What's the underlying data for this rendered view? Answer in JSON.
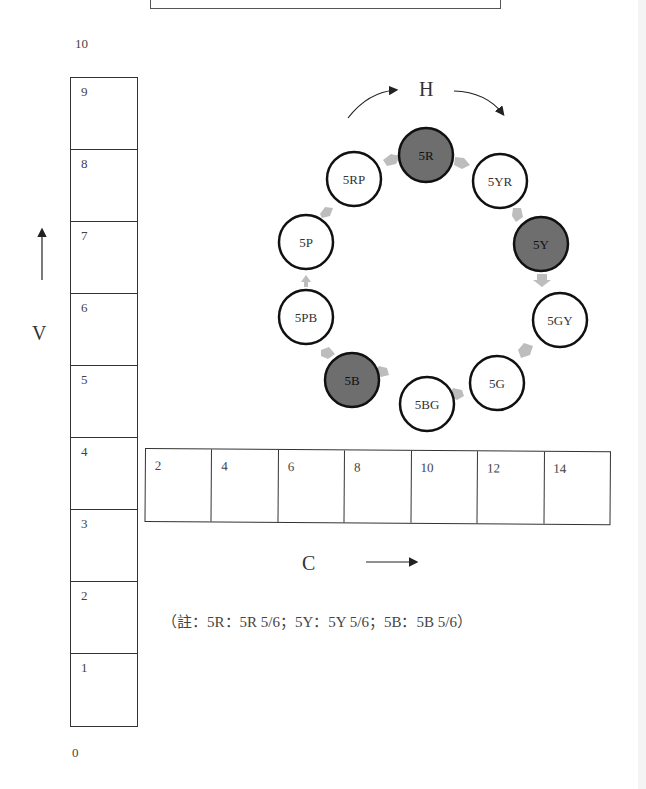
{
  "v_axis": {
    "letter": "V",
    "top_label": "10",
    "bottom_label": "0",
    "cells": [
      "9",
      "8",
      "7",
      "6",
      "5",
      "4",
      "3",
      "2",
      "1"
    ]
  },
  "c_axis": {
    "letter": "C",
    "cells": [
      "2",
      "4",
      "6",
      "8",
      "10",
      "12",
      "14"
    ]
  },
  "hue_wheel": {
    "letter": "H",
    "nodes": [
      {
        "label": "5R",
        "highlighted": true
      },
      {
        "label": "5YR",
        "highlighted": false
      },
      {
        "label": "5Y",
        "highlighted": true
      },
      {
        "label": "5GY",
        "highlighted": false
      },
      {
        "label": "5G",
        "highlighted": false
      },
      {
        "label": "5BG",
        "highlighted": false
      },
      {
        "label": "5B",
        "highlighted": true
      },
      {
        "label": "5PB",
        "highlighted": false
      },
      {
        "label": "5P",
        "highlighted": false
      },
      {
        "label": "5RP",
        "highlighted": false
      }
    ],
    "highlight_color": "#6e6e6e",
    "arrow_color": "#bdbdbd"
  },
  "note": "（註：5R：5R 5/6；5Y：5Y 5/6；5B：5B 5/6）"
}
